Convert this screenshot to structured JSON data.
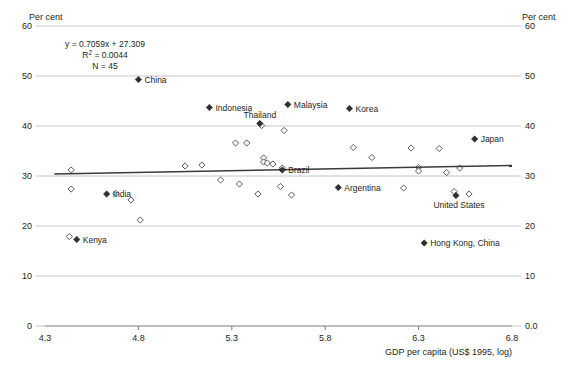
{
  "chart_data": {
    "type": "scatter",
    "title": "",
    "xlabel": "GDP per capita (US$ 1995, log)",
    "ylabel_left": "Per cent",
    "ylabel_right": "Per cent",
    "xlim": [
      4.3,
      6.8
    ],
    "ylim": [
      0,
      60
    ],
    "xticks": [
      "4.3",
      "4.8",
      "5.3",
      "5.8",
      "6.3",
      "6.8"
    ],
    "xtick_values": [
      4.3,
      4.8,
      5.3,
      5.8,
      6.3,
      6.8
    ],
    "yticks": [
      "0",
      "10",
      "20",
      "30",
      "40",
      "50",
      "60"
    ],
    "ytick_values": [
      0,
      10,
      20,
      30,
      40,
      50,
      60
    ],
    "yticks_right": [
      "0.0",
      "10",
      "20",
      "30",
      "40",
      "50",
      "60"
    ],
    "grid": true,
    "grid_axis": "y",
    "legend": "none",
    "annotations": {
      "equation": "y = 0.7059x + 27.309",
      "r_squared_prefix": "R",
      "r_squared_sup": "2",
      "r_squared": " = 0.0044",
      "n": "N = 45"
    },
    "trendline": {
      "slope": 0.7059,
      "intercept": 27.309,
      "r_squared": 0.0044,
      "n": 45,
      "x_start": 4.35,
      "y_start": 30.4,
      "x_end": 6.8,
      "y_end": 32.1
    },
    "labeled_points": [
      {
        "label": "China",
        "x": 4.8,
        "y": 49.3,
        "marker": "filled",
        "label_pos": "right"
      },
      {
        "label": "Indonesia",
        "x": 5.18,
        "y": 43.7,
        "marker": "filled",
        "label_pos": "right"
      },
      {
        "label": "Malaysia",
        "x": 5.6,
        "y": 44.3,
        "marker": "filled",
        "label_pos": "right"
      },
      {
        "label": "Korea",
        "x": 5.93,
        "y": 43.5,
        "marker": "filled",
        "label_pos": "right"
      },
      {
        "label": "Thailand",
        "x": 5.45,
        "y": 40.5,
        "marker": "filled",
        "label_pos": "above"
      },
      {
        "label": "Japan",
        "x": 6.6,
        "y": 37.4,
        "marker": "filled",
        "label_pos": "right"
      },
      {
        "label": "Brazil",
        "x": 5.57,
        "y": 31.2,
        "marker": "filled",
        "label_pos": "right"
      },
      {
        "label": "Argentina",
        "x": 5.87,
        "y": 27.7,
        "marker": "filled",
        "label_pos": "right"
      },
      {
        "label": "India",
        "x": 4.63,
        "y": 26.4,
        "marker": "filled",
        "label_pos": "right"
      },
      {
        "label": "Kenya",
        "x": 4.47,
        "y": 17.3,
        "marker": "filled",
        "label_pos": "right"
      },
      {
        "label": "Hong Kong, China",
        "x": 6.33,
        "y": 16.6,
        "marker": "filled",
        "label_pos": "right"
      },
      {
        "label": "United States",
        "x": 6.5,
        "y": 26.1,
        "marker": "filled",
        "label_pos": "below"
      }
    ],
    "unlabeled_points": [
      {
        "x": 4.44,
        "y": 31.2
      },
      {
        "x": 4.44,
        "y": 27.4
      },
      {
        "x": 4.43,
        "y": 17.9
      },
      {
        "x": 4.68,
        "y": 26.5
      },
      {
        "x": 4.76,
        "y": 25.2
      },
      {
        "x": 4.81,
        "y": 21.2
      },
      {
        "x": 5.05,
        "y": 32.0
      },
      {
        "x": 5.14,
        "y": 32.2
      },
      {
        "x": 5.24,
        "y": 29.2
      },
      {
        "x": 5.32,
        "y": 36.6
      },
      {
        "x": 5.38,
        "y": 36.6
      },
      {
        "x": 5.34,
        "y": 28.4
      },
      {
        "x": 5.46,
        "y": 40.1
      },
      {
        "x": 5.47,
        "y": 33.6
      },
      {
        "x": 5.47,
        "y": 32.8
      },
      {
        "x": 5.49,
        "y": 32.6
      },
      {
        "x": 5.44,
        "y": 26.4
      },
      {
        "x": 5.52,
        "y": 32.4
      },
      {
        "x": 5.58,
        "y": 39.1
      },
      {
        "x": 5.57,
        "y": 31.6
      },
      {
        "x": 5.56,
        "y": 27.9
      },
      {
        "x": 5.62,
        "y": 26.2
      },
      {
        "x": 5.95,
        "y": 35.7
      },
      {
        "x": 6.05,
        "y": 33.7
      },
      {
        "x": 6.26,
        "y": 35.6
      },
      {
        "x": 6.3,
        "y": 31.7
      },
      {
        "x": 6.3,
        "y": 31.0
      },
      {
        "x": 6.22,
        "y": 27.6
      },
      {
        "x": 6.41,
        "y": 35.5
      },
      {
        "x": 6.45,
        "y": 30.7
      },
      {
        "x": 6.52,
        "y": 31.6
      },
      {
        "x": 6.49,
        "y": 26.9
      },
      {
        "x": 6.57,
        "y": 26.4
      }
    ]
  }
}
